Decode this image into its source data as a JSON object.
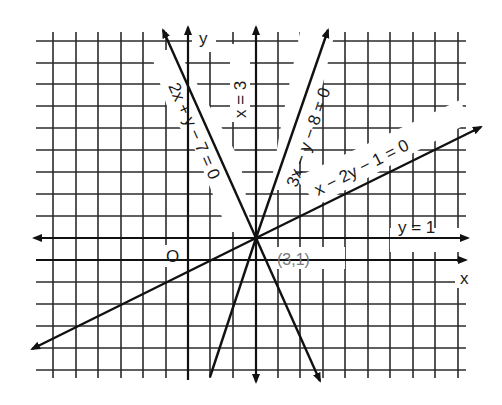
{
  "diagram": {
    "title": "",
    "type": "coordinate-plane-lines",
    "axes": {
      "x_label": "x",
      "y_label": "y",
      "origin_label": "O"
    },
    "grid": {
      "x_range": [
        -6,
        12
      ],
      "y_range": [
        -5,
        10
      ],
      "unit": 1
    },
    "lines": [
      {
        "id": "line-2x-y-7",
        "label": "2x + y − 7 = 0",
        "equation": "2x + y - 7 = 0"
      },
      {
        "id": "line-x-3",
        "label": "x = 3",
        "equation": "x = 3"
      },
      {
        "id": "line-3x-y-8",
        "label": "3x − y − 8 = 0",
        "equation": "3x - y - 8 = 0"
      },
      {
        "id": "line-x-2y-1",
        "label": "x − 2y − 1 = 0",
        "equation": "x - 2y - 1 = 0"
      },
      {
        "id": "line-y-1",
        "label": "y = 1",
        "equation": "y = 1"
      }
    ],
    "intersection": {
      "label": "(3,1)",
      "x": 3,
      "y": 1
    },
    "colors": {
      "ink": "#111111",
      "grid": "#2b2b2b",
      "point_label": "#7a7a7a",
      "background": "#ffffff"
    }
  }
}
